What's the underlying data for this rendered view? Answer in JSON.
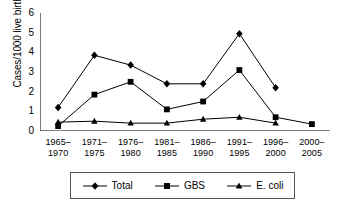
{
  "chart_data": {
    "type": "line",
    "title": "",
    "xlabel": "",
    "ylabel": "Cases/1000 live births",
    "ylim": [
      0,
      6
    ],
    "yticks": [
      0,
      1,
      2,
      3,
      4,
      5,
      6
    ],
    "grid": false,
    "legend_position": "bottom",
    "categories": [
      "1965–\n1970",
      "1971–\n1975",
      "1976–\n1980",
      "1981–\n1985",
      "1986–\n1990",
      "1991–\n1995",
      "1996–\n2000",
      "2000–\n2005"
    ],
    "category_lines": [
      [
        "1965–",
        "1970"
      ],
      [
        "1971–",
        "1975"
      ],
      [
        "1976–",
        "1980"
      ],
      [
        "1981–",
        "1985"
      ],
      [
        "1986–",
        "1990"
      ],
      [
        "1991–",
        "1995"
      ],
      [
        "1996–",
        "2000"
      ],
      [
        "2000–",
        "2005"
      ]
    ],
    "series": [
      {
        "name": "Total",
        "marker": "diamond",
        "color": "#000000",
        "values": [
          1.2,
          3.85,
          3.35,
          2.4,
          2.4,
          4.95,
          2.2,
          null
        ]
      },
      {
        "name": "GBS",
        "marker": "square",
        "color": "#000000",
        "values": [
          0.25,
          1.85,
          2.5,
          1.1,
          1.5,
          3.1,
          0.7,
          0.35
        ]
      },
      {
        "name": "E. coli",
        "marker": "triangle",
        "color": "#000000",
        "values": [
          0.45,
          0.5,
          0.4,
          0.4,
          0.6,
          0.7,
          0.4,
          null
        ]
      }
    ]
  },
  "legend": {
    "items": [
      {
        "label": "Total",
        "marker": "diamond"
      },
      {
        "label": "GBS",
        "marker": "square"
      },
      {
        "label": "E. coli",
        "marker": "triangle"
      }
    ]
  },
  "axes": {
    "y_title": "Cases/1000 live births"
  }
}
